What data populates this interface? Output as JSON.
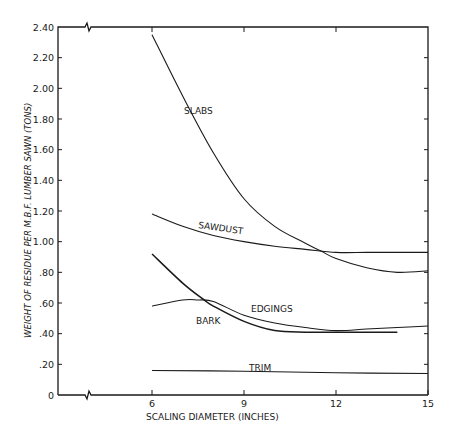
{
  "chart_data": {
    "type": "line",
    "title": "",
    "xlabel": "SCALING DIAMETER (INCHES)",
    "ylabel": "WEIGHT OF RESIDUE PER M.B.F. LUMBER SAWN (TONS)",
    "xlim": [
      6,
      15
    ],
    "ylim": [
      0,
      2.4
    ],
    "x_ticks": [
      "6",
      "9",
      "12",
      "15"
    ],
    "y_ticks": [
      "0",
      ".20",
      ".40",
      ".60",
      ".80",
      "1.00",
      "1.20",
      "1.40",
      "1.60",
      "1.80",
      "2.00",
      "2.20",
      "2.40"
    ],
    "axis_break": true,
    "grid": false,
    "legend": "inline labels",
    "series": [
      {
        "name": "SLABS",
        "x": [
          6,
          7,
          8,
          9,
          10,
          11,
          11.5,
          12,
          13,
          14,
          15
        ],
        "values": [
          2.35,
          1.95,
          1.58,
          1.28,
          1.1,
          0.99,
          0.94,
          0.89,
          0.83,
          0.8,
          0.81
        ]
      },
      {
        "name": "SAWDUST",
        "x": [
          6,
          7,
          8,
          9,
          10,
          11,
          12,
          13,
          14,
          15
        ],
        "values": [
          1.18,
          1.1,
          1.04,
          1.0,
          0.97,
          0.95,
          0.93,
          0.93,
          0.93,
          0.93
        ]
      },
      {
        "name": "EDGINGS",
        "x": [
          6,
          7,
          7.5,
          8,
          9,
          10,
          11,
          12,
          13,
          14,
          15
        ],
        "values": [
          0.58,
          0.62,
          0.62,
          0.61,
          0.52,
          0.47,
          0.44,
          0.42,
          0.43,
          0.44,
          0.45
        ]
      },
      {
        "name": "BARK",
        "x": [
          6,
          7,
          7.7,
          8,
          9,
          10,
          11,
          12,
          13,
          14
        ],
        "values": [
          0.92,
          0.73,
          0.62,
          0.58,
          0.48,
          0.42,
          0.41,
          0.41,
          0.41,
          0.41
        ]
      },
      {
        "name": "TRIM",
        "x": [
          6,
          9,
          12,
          15
        ],
        "values": [
          0.16,
          0.155,
          0.145,
          0.14
        ]
      }
    ]
  },
  "labels": {
    "slabs": "SLABS",
    "sawdust": "SAWDUST",
    "edgings": "EDGINGS",
    "bark": "BARK",
    "trim": "TRIM"
  },
  "axes": {
    "x_title": "SCALING DIAMETER (INCHES)",
    "y_title": "WEIGHT OF RESIDUE PER M.B.F. LUMBER SAWN (TONS)"
  }
}
